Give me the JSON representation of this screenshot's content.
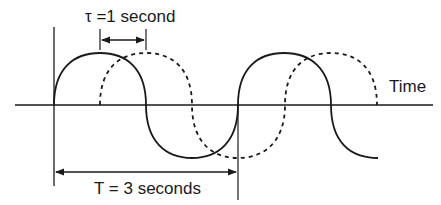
{
  "diagram": {
    "type": "waveform-phase-shift",
    "labels": {
      "tau": "τ =1 second",
      "period": "T = 3 seconds",
      "axis": "Time"
    },
    "colors": {
      "stroke": "#1a1a1a",
      "background": "#ffffff"
    },
    "series": [
      {
        "name": "original",
        "style": "solid",
        "start_x": 54,
        "end_x": 378
      },
      {
        "name": "delayed",
        "style": "dashed",
        "start_x": 100,
        "end_x": 377
      }
    ],
    "period_seconds": 3,
    "delay_seconds": 1
  }
}
